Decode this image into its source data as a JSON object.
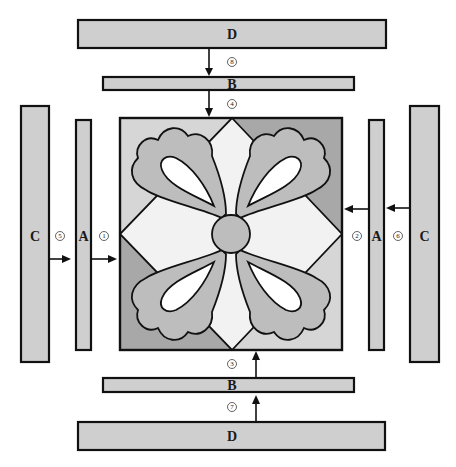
{
  "diagram": {
    "center_block": {
      "motif": "four-petal flower with circular center",
      "shapes": [
        "square background",
        "diamond (on-point square)",
        "petals",
        "center circle"
      ]
    },
    "strips": {
      "top_outer": {
        "label": "D"
      },
      "top_inner": {
        "label": "B"
      },
      "left_outer": {
        "label": "C"
      },
      "left_inner": {
        "label": "A"
      },
      "right_inner": {
        "label": "A"
      },
      "right_outer": {
        "label": "C"
      },
      "bottom_inner": {
        "label": "B"
      },
      "bottom_outer": {
        "label": "D"
      }
    },
    "steps": {
      "left_inner": "1",
      "right_inner": "2",
      "bottom_inner": "3",
      "top_inner": "4",
      "left_outer": "5",
      "right_outer": "6",
      "bottom_outer": "7",
      "top_outer": "8"
    },
    "colors": {
      "strip_fill": "#cfcfcf",
      "background_light": "#d6d6d6",
      "background_dark": "#a8a8a8",
      "diamond": "#f2f2f2",
      "petal": "#bdbdbd",
      "petal_inner": "#ffffff",
      "outline": "#111111"
    }
  }
}
